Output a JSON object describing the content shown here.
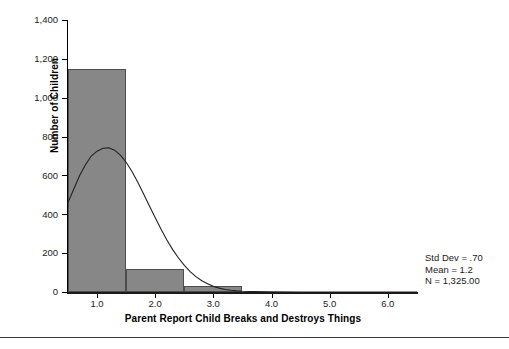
{
  "chart_data": {
    "type": "bar",
    "title": "",
    "subtitle": "",
    "xlabel": "Parent Report Child Breaks and Destroys Things",
    "ylabel": "Number of Children",
    "xlim": [
      0.5,
      6.5
    ],
    "ylim": [
      0,
      1400
    ],
    "grid": false,
    "legend": null,
    "bin_width": 1.0,
    "categories": [
      "1.0",
      "2.0",
      "3.0",
      "4.0",
      "5.0",
      "6.0"
    ],
    "bins": [
      {
        "center": 1.0,
        "start": 0.5,
        "end": 1.5,
        "value": 1150
      },
      {
        "center": 2.0,
        "start": 1.5,
        "end": 2.5,
        "value": 120
      },
      {
        "center": 3.0,
        "start": 2.5,
        "end": 3.5,
        "value": 30
      },
      {
        "center": 4.0,
        "start": 3.5,
        "end": 4.5,
        "value": 0
      },
      {
        "center": 5.0,
        "start": 4.5,
        "end": 5.5,
        "value": 0
      },
      {
        "center": 6.0,
        "start": 5.5,
        "end": 6.5,
        "value": 0
      }
    ],
    "values": [
      1150,
      120,
      30,
      0,
      0,
      0
    ],
    "yticks": [
      0,
      200,
      400,
      600,
      800,
      1000,
      1200,
      1400
    ],
    "ytick_labels": [
      "0",
      "200",
      "400",
      "600",
      "800",
      "1,000",
      "1,200",
      "1,400"
    ],
    "xticks": [
      1.0,
      2.0,
      3.0,
      4.0,
      5.0,
      6.0
    ],
    "xtick_labels": [
      "1.0",
      "2.0",
      "3.0",
      "4.0",
      "5.0",
      "6.0"
    ],
    "overlay_curve": {
      "name": "normal-distribution-curve",
      "peak_x": 1.2,
      "peak_y": 740,
      "points": [
        [
          0.5,
          460
        ],
        [
          0.6,
          530
        ],
        [
          0.7,
          600
        ],
        [
          0.8,
          655
        ],
        [
          0.9,
          700
        ],
        [
          1.0,
          725
        ],
        [
          1.1,
          740
        ],
        [
          1.2,
          742
        ],
        [
          1.3,
          730
        ],
        [
          1.4,
          705
        ],
        [
          1.5,
          668
        ],
        [
          1.6,
          620
        ],
        [
          1.7,
          565
        ],
        [
          1.8,
          505
        ],
        [
          1.9,
          443
        ],
        [
          2.0,
          382
        ],
        [
          2.1,
          323
        ],
        [
          2.2,
          268
        ],
        [
          2.3,
          218
        ],
        [
          2.4,
          175
        ],
        [
          2.5,
          137
        ],
        [
          2.6,
          105
        ],
        [
          2.7,
          79
        ],
        [
          2.8,
          58
        ],
        [
          2.9,
          42
        ],
        [
          3.0,
          29
        ],
        [
          3.1,
          20
        ],
        [
          3.2,
          13
        ],
        [
          3.3,
          9
        ],
        [
          3.4,
          6
        ],
        [
          3.5,
          4
        ],
        [
          3.7,
          2
        ],
        [
          4.0,
          1
        ],
        [
          4.5,
          0
        ],
        [
          6.5,
          0
        ]
      ]
    },
    "annotations": {
      "std_dev": "Std Dev = .70",
      "mean": "Mean = 1.2",
      "n": "N = 1,325.00"
    },
    "colors": {
      "bar_fill": "#878787",
      "bar_edge": "#4d4d4d",
      "curve": "#222222",
      "axis": "#000000",
      "text": "#1a1a1a",
      "background": "#ffffff"
    }
  }
}
